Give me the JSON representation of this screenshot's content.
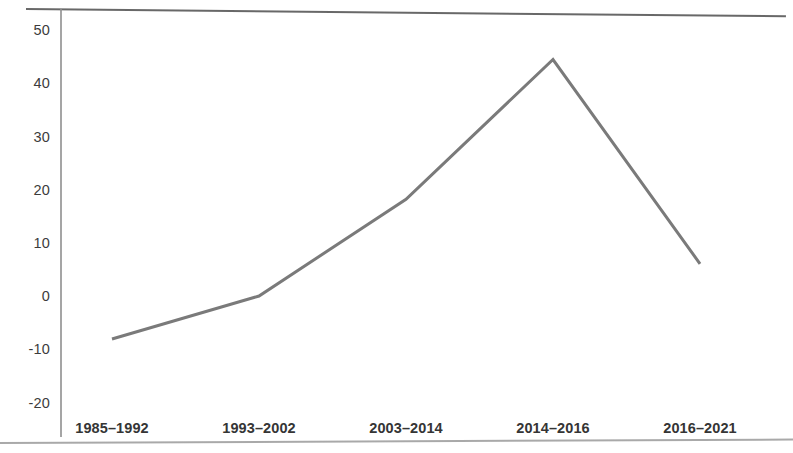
{
  "chart_data": {
    "type": "line",
    "title": "",
    "subtitle": "",
    "xlabel": "",
    "ylabel": "",
    "categories": [
      "1985–1992",
      "1993–2002",
      "2003–2014",
      "2014–2016",
      "2016–2021"
    ],
    "values": [
      -8,
      0,
      18,
      44,
      6
    ],
    "series": [
      {
        "name": "",
        "values": [
          -8,
          0,
          18,
          44,
          6
        ]
      }
    ],
    "ylim": [
      -20,
      50
    ],
    "ytick_labels": [
      "50",
      "40",
      "30",
      "20",
      "10",
      "0",
      "-10",
      "-20"
    ],
    "ytick_values": [
      50,
      40,
      30,
      20,
      10,
      0,
      -10,
      -20
    ],
    "grid": false,
    "legend": "none",
    "line_color": "#7a7a7a",
    "line_width": 3,
    "axis_color": "#8f8f8f",
    "text_color": "#353535",
    "background": "#ffffff"
  },
  "figure": {
    "y_axis_label_0": "50",
    "y_axis_label_1": "40",
    "y_axis_label_2": "30",
    "y_axis_label_3": "20",
    "y_axis_label_4": "10",
    "y_axis_label_5": "0",
    "y_axis_label_6": "-10",
    "y_axis_label_7": "-20",
    "x_axis_label_0": "1985–1992",
    "x_axis_label_1": "1993–2002",
    "x_axis_label_2": "2003–2014",
    "x_axis_label_3": "2014–2016",
    "x_axis_label_4": "2016–2021"
  }
}
